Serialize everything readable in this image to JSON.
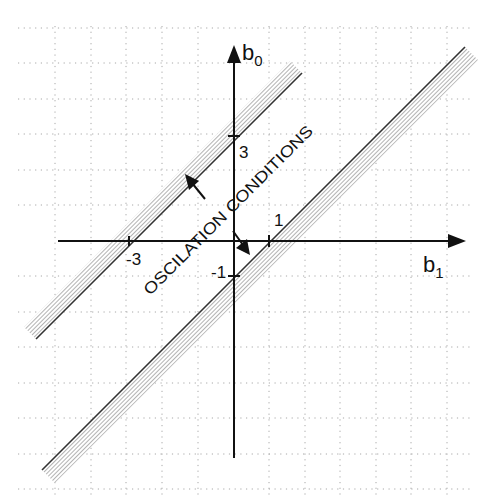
{
  "diagram": {
    "axes": {
      "x_label_main": "b",
      "x_label_sub": "1",
      "y_label_main": "b",
      "y_label_sub": "0"
    },
    "ticks": {
      "x_neg3": "-3",
      "x_pos1": "1",
      "y_pos3": "3",
      "y_neg1": "-1"
    },
    "annotation": "OSCILATION CONDITIONS",
    "boundaries": [
      {
        "name": "upper",
        "equation": "b0 = b1 + 3",
        "hatch_side": "upper-left"
      },
      {
        "name": "lower",
        "equation": "b0 = b1 - 1",
        "hatch_side": "lower-right"
      }
    ],
    "colors": {
      "axis": "#111111",
      "grid": "#9a9a9a",
      "hatch": "#8a8a8a"
    }
  }
}
